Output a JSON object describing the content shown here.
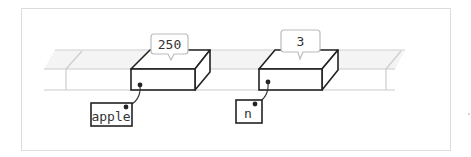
{
  "diagram": {
    "variables": [
      {
        "name": "apple",
        "value": "250"
      },
      {
        "name": "n",
        "value": "3"
      }
    ],
    "colors": {
      "frame_border": "#dcdcdc",
      "shelf_top": "#f3f3f3",
      "shelf_line": "#c8c8c8",
      "box_stroke": "#222222",
      "bubble_stroke": "#bbbbbb",
      "text": "#333333"
    }
  }
}
